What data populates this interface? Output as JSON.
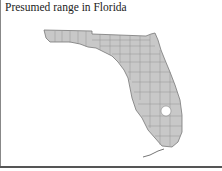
{
  "map": {
    "title": "Presumed range in Florida",
    "region": "Florida",
    "fill_color": "#c8c8c8",
    "border_color": "#777777",
    "lake_color": "#ffffff"
  }
}
